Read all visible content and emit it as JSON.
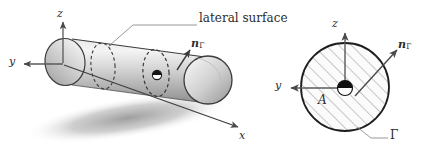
{
  "figure": {
    "background_color": "#ffffff",
    "ink_color": "#2b2b2b",
    "shadow_color": "#9a9a9a",
    "hatch_color": "#9a9a9a",
    "cylinder_fill_light": "#efefef",
    "cylinder_fill_dark": "#9d9d9d"
  },
  "left_panel": {
    "name": "cylinder-3d-view",
    "annotation": {
      "lateral_surface_label": "lateral surface"
    },
    "axes": [
      {
        "name": "z",
        "label": "z",
        "direction": "up"
      },
      {
        "name": "y",
        "label": "y",
        "direction": "left"
      },
      {
        "name": "x",
        "label": "x",
        "direction": "down-right"
      }
    ],
    "normal_vector": {
      "symbol": "n",
      "subscript": "Γ",
      "direction": "up-right"
    },
    "origin_marker": "quadrant-disc",
    "cross_section_rings": 2
  },
  "right_panel": {
    "name": "cross-section-view",
    "axes": [
      {
        "name": "z",
        "label": "z",
        "direction": "up"
      },
      {
        "name": "y",
        "label": "y",
        "direction": "left"
      }
    ],
    "normal_vector": {
      "symbol": "n",
      "subscript": "Γ",
      "direction": "up-right"
    },
    "area_label": "A",
    "boundary_label": "Γ",
    "origin_marker": "quadrant-disc",
    "fill": "diagonal-hatch"
  }
}
